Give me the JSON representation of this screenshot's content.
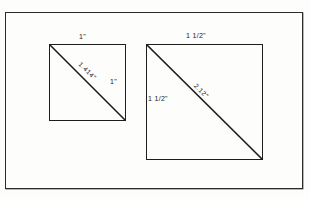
{
  "figure": {
    "background_color": "#fdfdfc",
    "stroke_color": "#1d1d1d",
    "frame_color": "#2b2b2b"
  },
  "shapes": [
    {
      "id": "small-square",
      "name": "small square",
      "labels": {
        "top": "1\"",
        "right": "1\"",
        "diagonal": "1.414\""
      }
    },
    {
      "id": "large-square",
      "name": "large square",
      "labels": {
        "top": "1 1/2\"",
        "left": "1 1/2\"",
        "diagonal": "2.12\""
      }
    }
  ]
}
